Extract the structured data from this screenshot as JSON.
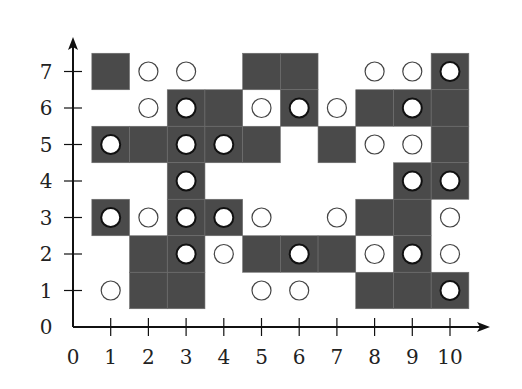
{
  "diagram": {
    "type": "grid-diagram",
    "colors": {
      "cell": "#4a4a4a",
      "cell_border": "#6e6e6e",
      "axis": "#111111",
      "disk_fill": "#ffffff",
      "disk_stroke": "#111111",
      "open_circle_stroke": "#444444"
    },
    "x_axis": {
      "min": 0,
      "max": 10,
      "ticks": [
        "0",
        "1",
        "2",
        "3",
        "4",
        "5",
        "6",
        "7",
        "8",
        "9",
        "10"
      ]
    },
    "y_axis": {
      "min": 0,
      "max": 7,
      "ticks": [
        "0",
        "1",
        "2",
        "3",
        "4",
        "5",
        "6",
        "7"
      ]
    },
    "dark_cells": [
      [
        1,
        7
      ],
      [
        5,
        7
      ],
      [
        6,
        7
      ],
      [
        10,
        7
      ],
      [
        3,
        6
      ],
      [
        4,
        6
      ],
      [
        6,
        6
      ],
      [
        8,
        6
      ],
      [
        9,
        6
      ],
      [
        10,
        6
      ],
      [
        1,
        5
      ],
      [
        2,
        5
      ],
      [
        3,
        5
      ],
      [
        4,
        5
      ],
      [
        5,
        5
      ],
      [
        7,
        5
      ],
      [
        10,
        5
      ],
      [
        3,
        4
      ],
      [
        9,
        4
      ],
      [
        10,
        4
      ],
      [
        1,
        3
      ],
      [
        3,
        3
      ],
      [
        4,
        3
      ],
      [
        8,
        3
      ],
      [
        9,
        3
      ],
      [
        2,
        2
      ],
      [
        3,
        2
      ],
      [
        5,
        2
      ],
      [
        6,
        2
      ],
      [
        7,
        2
      ],
      [
        9,
        2
      ],
      [
        2,
        1
      ],
      [
        3,
        1
      ],
      [
        8,
        1
      ],
      [
        9,
        1
      ],
      [
        10,
        1
      ]
    ],
    "filled_disks": [
      [
        10,
        7
      ],
      [
        3,
        6
      ],
      [
        6,
        6
      ],
      [
        9,
        6
      ],
      [
        1,
        5
      ],
      [
        3,
        5
      ],
      [
        4,
        5
      ],
      [
        3,
        4
      ],
      [
        9,
        4
      ],
      [
        10,
        4
      ],
      [
        1,
        3
      ],
      [
        3,
        3
      ],
      [
        4,
        3
      ],
      [
        3,
        2
      ],
      [
        6,
        2
      ],
      [
        9,
        2
      ],
      [
        10,
        1
      ]
    ],
    "open_circles": [
      [
        2,
        7
      ],
      [
        3,
        7
      ],
      [
        8,
        7
      ],
      [
        9,
        7
      ],
      [
        2,
        6
      ],
      [
        5,
        6
      ],
      [
        7,
        6
      ],
      [
        8,
        5
      ],
      [
        9,
        5
      ],
      [
        2,
        3
      ],
      [
        5,
        3
      ],
      [
        7,
        3
      ],
      [
        10,
        3
      ],
      [
        4,
        2
      ],
      [
        8,
        2
      ],
      [
        10,
        2
      ],
      [
        1,
        1
      ],
      [
        5,
        1
      ],
      [
        6,
        1
      ]
    ]
  }
}
